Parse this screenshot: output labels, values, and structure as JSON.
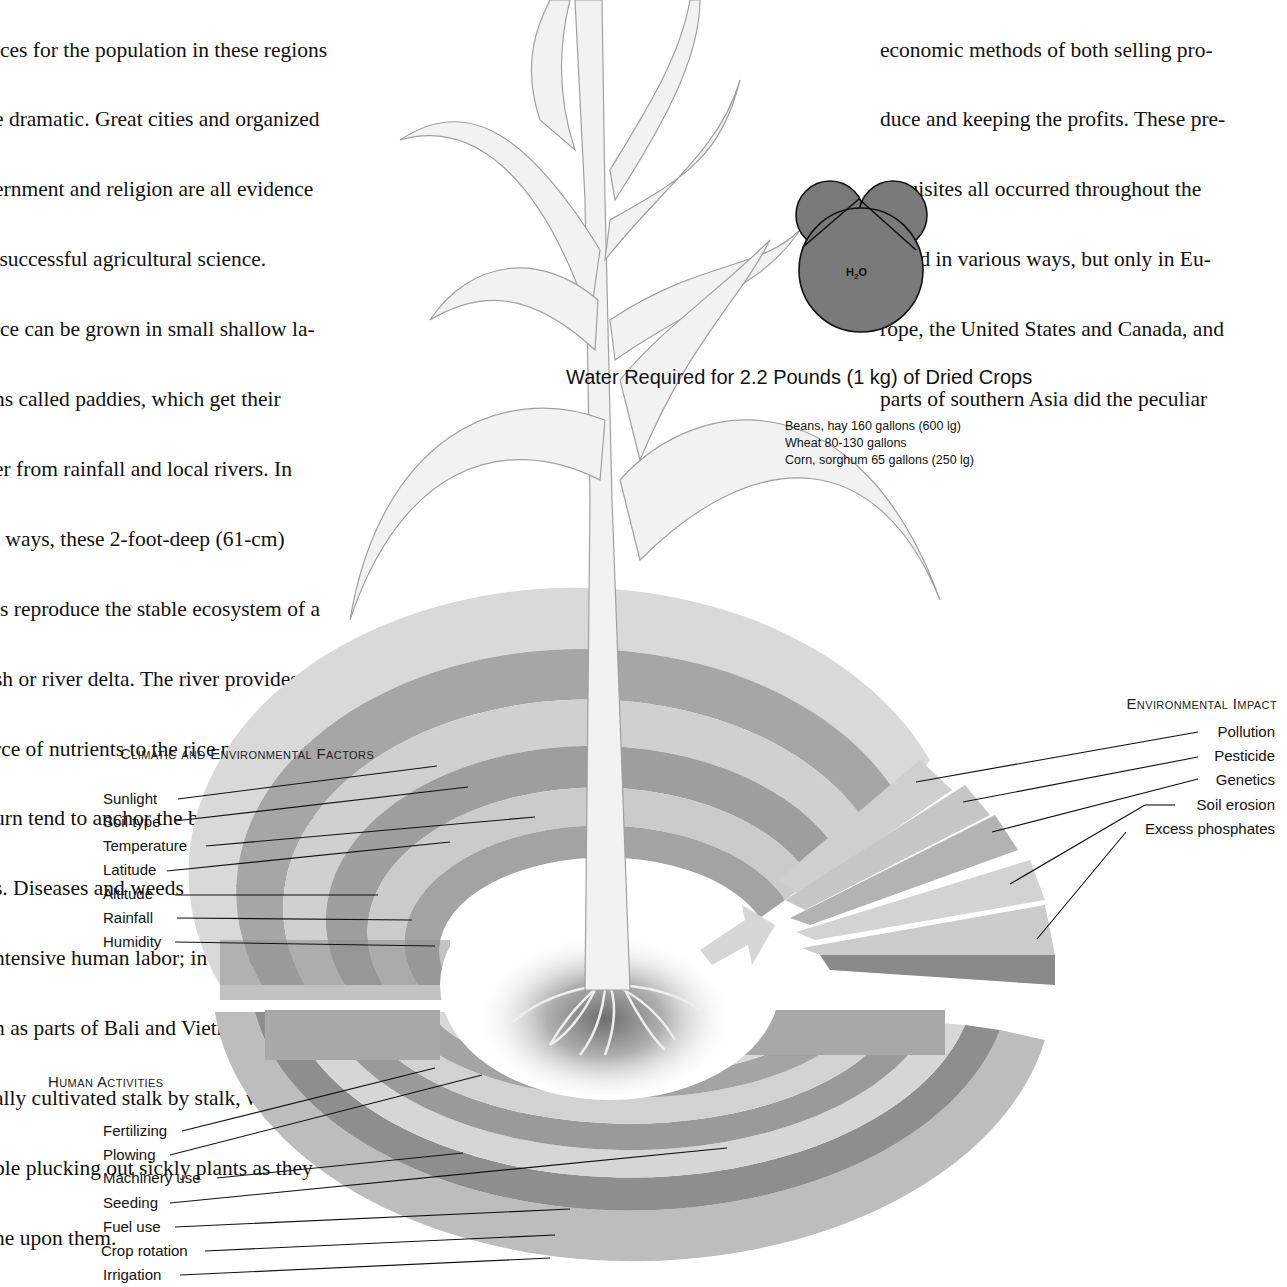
{
  "left_column": {
    "lines": [
      "ices for the population in these regions",
      "e dramatic. Great cities and organized",
      "ernment and religion are all evidence",
      " successful agricultural science.",
      "ice can be grown in small shallow la-",
      "ns called paddies, which get their",
      "er from rainfall and local rivers. In",
      "t ways, these 2-foot-deep (61-cm)",
      "ls reproduce the stable ecosystem of a",
      "sh or river delta. The river provides a",
      "rce of nutrients to the rice plants, which",
      "urn tend to anchor the bottom with their",
      "s. Diseases and weeds are prevented",
      "ntensive human labor; in some places,",
      "h as parts of Bali and Vietnam, rice is",
      "ally cultivated stalk by stalk, with",
      "ple plucking out sickly plants as they",
      "ne upon them."
    ]
  },
  "right_column": {
    "lines": [
      "economic methods of both selling pro-",
      "duce and keeping the profits. These pre-",
      "requisites all occurred throughout the",
      "world in various ways, but only in Eu-",
      "rope, the United States and Canada, and",
      "parts of southern Asia did the peculiar"
    ]
  },
  "water_molecule": {
    "label_main": "H",
    "label_sub": "2",
    "label_end": "O",
    "fill_color": "#7a7a7a"
  },
  "water_requirements": {
    "title": "Water Required for 2.2 Pounds (1 kg) of Dried Crops",
    "items": [
      "Beans, hay 160 gallons (600 lg)",
      "Wheat 80-130 gallons",
      "Corn, sorghum 65 gallons (250 lg)"
    ]
  },
  "climatic_factors": {
    "title": "Climatic and Environmental Factors",
    "items": [
      "Sunlight",
      "Soil type",
      "Temperature",
      "Latitude",
      "Altitude",
      "Rainfall",
      "Humidity"
    ]
  },
  "human_activities": {
    "title": "Human Activities",
    "items": [
      "Fertilizing",
      "Plowing",
      "Machinery use",
      "Seeding",
      "Fuel use",
      "Crop rotation",
      "Irrigation"
    ]
  },
  "environmental_impact": {
    "title": "Environmental Impact",
    "items": [
      "Pollution",
      "Pesticide",
      "Genetics",
      "Soil erosion",
      "Excess phosphates"
    ]
  },
  "colors": {
    "ring_light": "#d4d4d4",
    "ring_mid": "#a9a9a9",
    "ring_dark": "#8c8c8c",
    "plant_fill": "#f0f0f0",
    "plant_stroke": "#9a9a9a"
  }
}
